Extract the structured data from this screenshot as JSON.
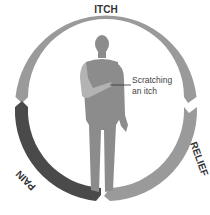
{
  "diagram": {
    "stages": [
      {
        "label": "ITCH",
        "color": "#9a9a9a"
      },
      {
        "label": "RELIEF",
        "color": "#9a9a9a"
      },
      {
        "label": "PAIN",
        "color": "#4a4a4a"
      }
    ],
    "annotation": {
      "line1": "Scratching",
      "line2": "an itch"
    },
    "colors": {
      "figure": "#8c8c8c",
      "arm_highlight": "#b3b3b3",
      "text": "#333333"
    }
  }
}
